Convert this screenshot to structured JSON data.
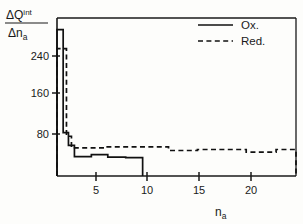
{
  "chart_data": {
    "type": "line",
    "title": "",
    "subtitle": "",
    "xlabel": "n_a",
    "xlabel_base": "n",
    "xlabel_sub": "a",
    "ylabel": "ΔQ^int / Δn_a",
    "ylabel_numerator_base": "ΔQ",
    "ylabel_numerator_sup": "int",
    "ylabel_denominator_base": "Δn",
    "ylabel_denominator_sub": "a",
    "xlim": [
      0,
      24
    ],
    "ylim": [
      0,
      310
    ],
    "xticks": [
      5,
      10,
      15,
      20
    ],
    "xticklabels": [
      "5",
      "10",
      "15",
      "20"
    ],
    "yticks": [
      80,
      160,
      240
    ],
    "yticklabels": [
      "80",
      "160",
      "240"
    ],
    "grid": false,
    "legend_position": "top-right",
    "series": [
      {
        "name": "Ox.",
        "style": "solid",
        "color": "#111111",
        "steps": [
          {
            "x0": 0.0,
            "x1": 0.62,
            "y": 287
          },
          {
            "x0": 0.62,
            "x1": 1.15,
            "y": 85
          },
          {
            "x0": 1.15,
            "x1": 1.75,
            "y": 60
          },
          {
            "x0": 1.75,
            "x1": 3.45,
            "y": 38
          },
          {
            "x0": 3.45,
            "x1": 5.1,
            "y": 42
          },
          {
            "x0": 5.1,
            "x1": 6.9,
            "y": 37
          },
          {
            "x0": 6.9,
            "x1": 8.6,
            "y": 36
          }
        ]
      },
      {
        "name": "Red.",
        "style": "dashed",
        "color": "#111111",
        "steps": [
          {
            "x0": 0.0,
            "x1": 0.95,
            "y": 250
          },
          {
            "x0": 0.95,
            "x1": 1.45,
            "y": 78
          },
          {
            "x0": 1.45,
            "x1": 4.85,
            "y": 55
          },
          {
            "x0": 4.85,
            "x1": 11.2,
            "y": 57
          },
          {
            "x0": 11.2,
            "x1": 14.1,
            "y": 50
          },
          {
            "x0": 14.1,
            "x1": 19.0,
            "y": 52
          },
          {
            "x0": 19.0,
            "x1": 22.0,
            "y": 47
          },
          {
            "x0": 22.0,
            "x1": 24.0,
            "y": 52
          }
        ]
      }
    ],
    "legend": [
      {
        "label": "Ox.",
        "style": "solid"
      },
      {
        "label": "Red.",
        "style": "dashed"
      }
    ]
  },
  "figure": {
    "caption": ""
  }
}
